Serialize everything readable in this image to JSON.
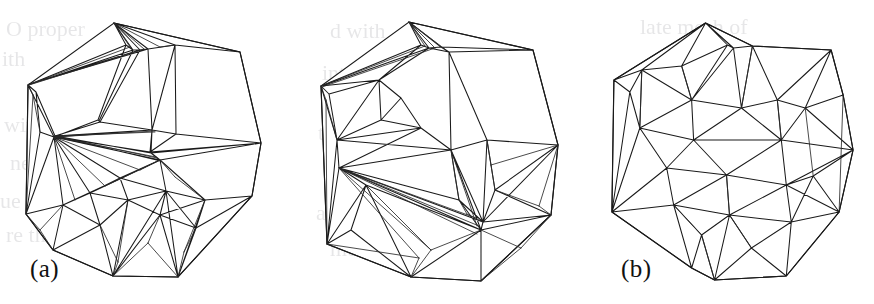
{
  "figure": {
    "caption_labels": [
      "(a)",
      "(b)",
      "(c)"
    ],
    "panel_count": 3,
    "ink_color": "#1a1a1a",
    "background_color": "#ffffff"
  },
  "panels": [
    {
      "id": "a",
      "label": "(a)",
      "kind": "triangulation-with-slivers",
      "boundary_vertex_count": 12,
      "interior_vertex_count": 23
    },
    {
      "id": "b",
      "label": "(b)",
      "kind": "triangulation-with-slivers",
      "boundary_vertex_count": 12,
      "interior_vertex_count": 22
    },
    {
      "id": "c",
      "label": "(c)",
      "kind": "well-shaped-delaunay-triangulation",
      "boundary_vertex_count": 14,
      "interior_vertex_count": 30
    }
  ],
  "bleedthrough": {
    "lines": [
      "O proper",
      "ith",
      "with",
      "ne",
      "ue time",
      "re the",
      "d with",
      "interpolation",
      "the els",
      "n the",
      "are the",
      "mesh is",
      "late mesh of",
      "ning f",
      "mu",
      "sh vertic"
    ]
  }
}
